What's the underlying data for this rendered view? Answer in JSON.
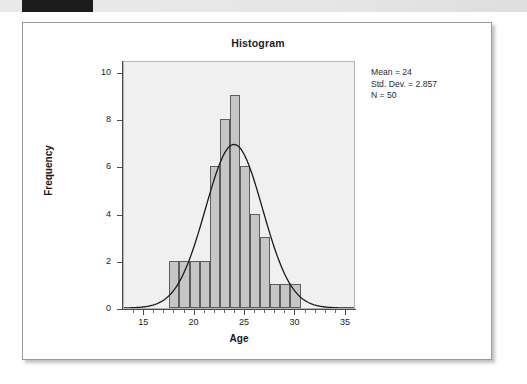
{
  "page": {
    "top_strip_tab": ""
  },
  "chart": {
    "title": "Histogram",
    "x_axis_title": "Age",
    "y_axis_title": "Frequency",
    "stats": {
      "mean": "Mean = 24",
      "std_dev": "Std. Dev. = 2.857",
      "n": "N = 50"
    },
    "colors": {
      "bar_fill": "#c6c6c6",
      "bar_stroke": "#5d5d5d",
      "plot_background": "#f0f0f0",
      "curve": "#1a1a1a",
      "axis": "#4a4a4a"
    }
  },
  "chart_data": {
    "type": "bar",
    "title": "Histogram",
    "xlabel": "Age",
    "ylabel": "Frequency",
    "xlim": [
      13,
      36
    ],
    "ylim": [
      0,
      10.5
    ],
    "grid": false,
    "legend": null,
    "bin_width": 1,
    "categories": [
      18,
      19,
      20,
      21,
      22,
      23,
      24,
      25,
      26,
      27,
      28,
      29,
      30
    ],
    "values": [
      2,
      2,
      2,
      2,
      6,
      8,
      9,
      6,
      4,
      3,
      1,
      1,
      1
    ],
    "x_ticks": [
      15,
      20,
      25,
      30,
      35
    ],
    "y_ticks": [
      0,
      2,
      4,
      6,
      8,
      10
    ],
    "annotations": {
      "mean": 24,
      "std_dev": 2.857,
      "n": 50
    },
    "overlay": {
      "type": "normal-curve",
      "mean": 24,
      "std_dev": 2.857,
      "scale_n": 50,
      "peak_value": 6.98
    }
  }
}
